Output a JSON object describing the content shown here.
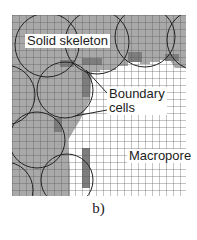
{
  "figure": {
    "caption": "b)",
    "labels": {
      "solid": "Solid skeleton",
      "boundary_line1": "Boundary",
      "boundary_line2": "cells",
      "macropore": "Macropore"
    },
    "colors": {
      "solid_fill": "#a9a9a9",
      "boundary_fill": "#7d7d7d",
      "pore_fill": "#ffffff",
      "grid_line": "#555555",
      "circle_stroke": "#222222"
    },
    "grid": {
      "x0": 12,
      "y0": 15,
      "x1": 186,
      "y1": 196,
      "cell": 7
    }
  }
}
